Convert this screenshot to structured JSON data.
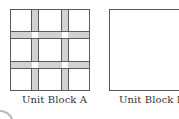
{
  "diagram": {
    "blocks": [
      {
        "id": "A",
        "label": "Unit Block A",
        "pattern": "3x3 grid with 2 vertical and 2 horizontal shaded bands; white squares at band intersections"
      },
      {
        "id": "B",
        "label": "Unit Block B",
        "pattern": "plain empty square"
      }
    ],
    "colors": {
      "band_fill": "#d2d2d2",
      "outline": "#5a5a5a",
      "background": "#ffffff",
      "label_text": "#333333"
    }
  }
}
